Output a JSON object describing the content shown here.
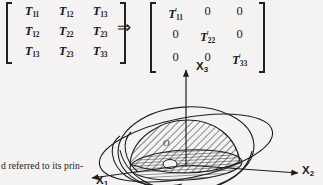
{
  "equation": {
    "implies_symbol": "⇒",
    "source_matrix": {
      "name": "symmetric stress tensor",
      "rows": [
        [
          {
            "symbol": "T",
            "sub": "11",
            "prime": false
          },
          {
            "symbol": "T",
            "sub": "12",
            "prime": false
          },
          {
            "symbol": "T",
            "sub": "13",
            "prime": false
          }
        ],
        [
          {
            "symbol": "T",
            "sub": "12",
            "prime": false
          },
          {
            "symbol": "T",
            "sub": "22",
            "prime": false
          },
          {
            "symbol": "T",
            "sub": "23",
            "prime": false
          }
        ],
        [
          {
            "symbol": "T",
            "sub": "13",
            "prime": false
          },
          {
            "symbol": "T",
            "sub": "23",
            "prime": false
          },
          {
            "symbol": "T",
            "sub": "33",
            "prime": false
          }
        ]
      ]
    },
    "result_matrix": {
      "name": "diagonalized principal tensor",
      "rows": [
        [
          {
            "symbol": "T",
            "sub": "11",
            "prime": true
          },
          {
            "symbol": "0",
            "sub": "",
            "prime": false
          },
          {
            "symbol": "0",
            "sub": "",
            "prime": false
          }
        ],
        [
          {
            "symbol": "0",
            "sub": "",
            "prime": false
          },
          {
            "symbol": "T",
            "sub": "22",
            "prime": true
          },
          {
            "symbol": "0",
            "sub": "",
            "prime": false
          }
        ],
        [
          {
            "symbol": "0",
            "sub": "",
            "prime": false
          },
          {
            "symbol": "0",
            "sub": "",
            "prime": false
          },
          {
            "symbol": "T",
            "sub": "33",
            "prime": true
          }
        ]
      ]
    }
  },
  "figure": {
    "name": "stress-ellipsoid-principal-axes",
    "axes": [
      {
        "id": "x3",
        "label_base": "X",
        "label_sub": "3",
        "direction": "up"
      },
      {
        "id": "x2",
        "label_base": "X",
        "label_sub": "2",
        "direction": "right"
      },
      {
        "id": "x1",
        "label_base": "X",
        "label_sub": "1",
        "direction": "down-left"
      }
    ],
    "origin_label": "O",
    "ink_color": "#201e1d",
    "background_color": "#f4f3f1"
  },
  "caption": {
    "text": "d referred to its prin-"
  }
}
